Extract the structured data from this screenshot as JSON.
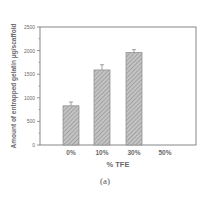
{
  "chart_data": {
    "type": "bar",
    "title": "",
    "xlabel": "% TFE",
    "ylabel": "Amount of entrapped gelatin μg/scaffold",
    "categories": [
      "0%",
      "10%",
      "30%",
      "50%"
    ],
    "values": [
      830,
      1590,
      1960,
      0
    ],
    "errors": [
      80,
      110,
      60,
      0
    ],
    "ylim": [
      0,
      2500
    ],
    "yticks": [
      0,
      500,
      1000,
      1500,
      2000,
      2500
    ],
    "grid": false,
    "legend": null,
    "bar_fill": "hatched gray",
    "caption": "(a)"
  },
  "colors": {
    "axis": "#7a7a7a",
    "bar_fill": "#b8b8b8",
    "bar_hatch": "#8c8c8c",
    "text": "#6a6a6a"
  }
}
